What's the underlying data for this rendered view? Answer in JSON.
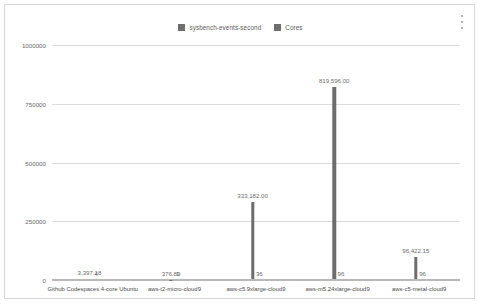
{
  "card": {
    "menu_icon": "kebab-menu-icon"
  },
  "legend": {
    "position": "top-center",
    "items": [
      {
        "label": "sysbench-events-second",
        "color": "#6f6f6f"
      },
      {
        "label": "Cores",
        "color": "#6f6f6f"
      }
    ]
  },
  "chart_data": {
    "type": "bar",
    "title": "",
    "subtitle": "",
    "xlabel": "",
    "ylabel": "",
    "grid": true,
    "ylim": [
      0,
      1000000
    ],
    "yticks": [
      0,
      250000,
      500000,
      750000,
      1000000
    ],
    "ytick_labels": [
      "0",
      "250000",
      "500000",
      "750000",
      "1000000"
    ],
    "legend_position": "top-center",
    "categories": [
      "Github Codespaces 4-core Ubuntu",
      "aws-t2-micro-cloud9",
      "aws-c5.9xlarge-cloud9",
      "aws-m5.24xlarge-cloud9",
      "aws-c5-metal-cloud9"
    ],
    "series": [
      {
        "name": "sysbench-events-second",
        "color": "#6d6d6d",
        "values": [
          3397.18,
          376.89,
          333182.0,
          819596.0,
          96422.15
        ],
        "labels": [
          "3,397.18",
          "376.89",
          "333,182.00",
          "819,596.00",
          "96,422.15"
        ]
      },
      {
        "name": "Cores",
        "color": "#6d6d6d",
        "values": [
          4,
          1,
          36,
          96,
          96
        ],
        "labels": [
          "4",
          "1",
          "36",
          "96",
          "96"
        ]
      }
    ]
  }
}
